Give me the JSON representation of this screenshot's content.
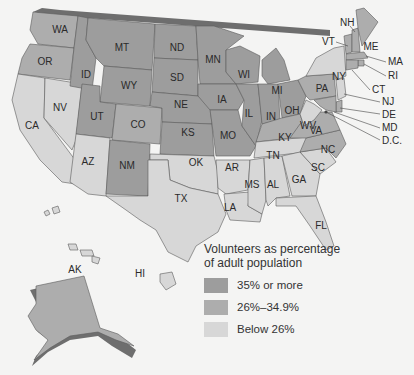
{
  "colors": {
    "high": "#9d9d9d",
    "mid": "#adadad",
    "low": "#d7d7d7",
    "shadow": "#6e6e6e",
    "background": "#f4f4f3"
  },
  "legend": {
    "title_line1": "Volunteers as percentage",
    "title_line2": "of adult population",
    "items": [
      {
        "label": "35% or more",
        "color": "#9d9d9d"
      },
      {
        "label": "26%–34.9%",
        "color": "#adadad"
      },
      {
        "label": "Below 26%",
        "color": "#d7d7d7"
      }
    ]
  },
  "states": {
    "WA": "WA",
    "OR": "OR",
    "CA": "CA",
    "NV": "NV",
    "ID": "ID",
    "MT": "MT",
    "WY": "WY",
    "UT": "UT",
    "CO": "CO",
    "AZ": "AZ",
    "NM": "NM",
    "ND": "ND",
    "SD": "SD",
    "NE": "NE",
    "KS": "KS",
    "OK": "OK",
    "TX": "TX",
    "MN": "MN",
    "IA": "IA",
    "MO": "MO",
    "AR": "AR",
    "LA": "LA",
    "WI": "WI",
    "IL": "IL",
    "MI": "MI",
    "IN": "IN",
    "OH": "OH",
    "KY": "KY",
    "TN": "TN",
    "MS": "MS",
    "AL": "AL",
    "GA": "GA",
    "FL": "FL",
    "SC": "SC",
    "NC": "NC",
    "VA": "VA",
    "WV": "WV",
    "PA": "PA",
    "NY": "NY",
    "VT": "VT",
    "NH": "NH",
    "ME": "ME",
    "MA": "MA",
    "RI": "RI",
    "CT": "CT",
    "NJ": "NJ",
    "DE": "DE",
    "MD": "MD",
    "DC": "D.C.",
    "AK": "AK",
    "HI": "HI"
  }
}
